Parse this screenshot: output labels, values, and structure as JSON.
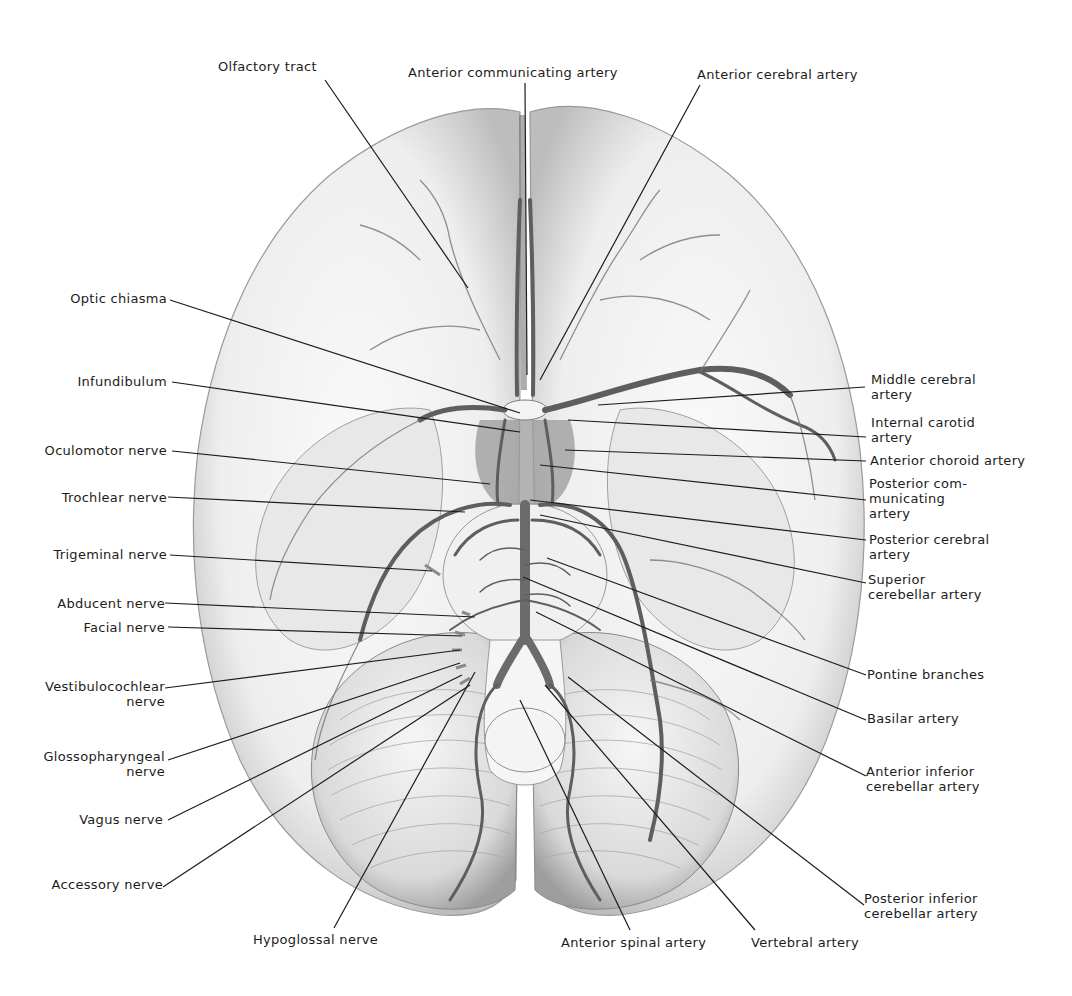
{
  "figure": {
    "labels": {
      "top": [
        {
          "id": "olfactory-tract",
          "lines": [
            "Olfactory tract"
          ]
        },
        {
          "id": "anterior-communicating-artery",
          "lines": [
            "Anterior communicating artery"
          ]
        },
        {
          "id": "anterior-cerebral-artery",
          "lines": [
            "Anterior cerebral artery"
          ]
        }
      ],
      "left": [
        {
          "id": "optic-chiasma",
          "lines": [
            "Optic chiasma"
          ]
        },
        {
          "id": "infundibulum",
          "lines": [
            "Infundibulum"
          ]
        },
        {
          "id": "oculomotor-nerve",
          "lines": [
            "Oculomotor nerve"
          ]
        },
        {
          "id": "trochlear-nerve",
          "lines": [
            "Trochlear nerve"
          ]
        },
        {
          "id": "trigeminal-nerve",
          "lines": [
            "Trigeminal nerve"
          ]
        },
        {
          "id": "abducent-nerve",
          "lines": [
            "Abducent nerve"
          ]
        },
        {
          "id": "facial-nerve",
          "lines": [
            "Facial nerve"
          ]
        },
        {
          "id": "vestibulocochlear-nerve",
          "lines": [
            "Vestibulocochlear",
            "nerve"
          ]
        },
        {
          "id": "glossopharyngeal-nerve",
          "lines": [
            "Glossopharyngeal",
            "nerve"
          ]
        },
        {
          "id": "vagus-nerve",
          "lines": [
            "Vagus nerve"
          ]
        },
        {
          "id": "accessory-nerve",
          "lines": [
            "Accessory nerve"
          ]
        }
      ],
      "right": [
        {
          "id": "middle-cerebral-artery",
          "lines": [
            "Middle cerebral",
            "artery"
          ]
        },
        {
          "id": "internal-carotid-artery",
          "lines": [
            "Internal carotid",
            "artery"
          ]
        },
        {
          "id": "anterior-choroid-artery",
          "lines": [
            "Anterior choroid artery"
          ]
        },
        {
          "id": "posterior-communicating-artery",
          "lines": [
            "Posterior com-",
            "municating",
            "artery"
          ]
        },
        {
          "id": "posterior-cerebral-artery",
          "lines": [
            "Posterior cerebral",
            "artery"
          ]
        },
        {
          "id": "superior-cerebellar-artery",
          "lines": [
            "Superior",
            "cerebellar artery"
          ]
        },
        {
          "id": "pontine-branches",
          "lines": [
            "Pontine branches"
          ]
        },
        {
          "id": "basilar-artery",
          "lines": [
            "Basilar artery"
          ]
        },
        {
          "id": "anterior-inferior-cerebellar-artery",
          "lines": [
            "Anterior inferior",
            "cerebellar artery"
          ]
        },
        {
          "id": "posterior-inferior-cerebellar-artery",
          "lines": [
            "Posterior inferior",
            "cerebellar artery"
          ]
        }
      ],
      "bottom": [
        {
          "id": "hypoglossal-nerve",
          "lines": [
            "Hypoglossal nerve"
          ]
        },
        {
          "id": "anterior-spinal-artery",
          "lines": [
            "Anterior spinal artery"
          ]
        },
        {
          "id": "vertebral-artery",
          "lines": [
            "Vertebral artery"
          ]
        }
      ]
    },
    "colors": {
      "background": "#ffffff",
      "text": "#1c1c1c",
      "vessel": "#5a5a5a",
      "brain_fill": "#f2f2f2",
      "shadow": "#b8b8b8"
    }
  }
}
